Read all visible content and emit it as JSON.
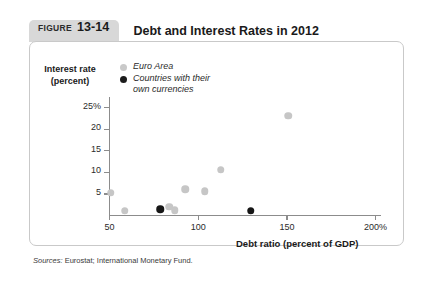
{
  "figure": {
    "label_word": "FIGURE",
    "number": "13-14",
    "title": "Debt and Interest Rates in 2012"
  },
  "legend": {
    "items": [
      {
        "label": "Euro Area",
        "color": "#c9c9c9",
        "series": "euro"
      },
      {
        "label": "Countries with their\nown currencies",
        "color": "#1c1c1c",
        "series": "own"
      }
    ]
  },
  "source": {
    "prefix": "Sources:",
    "text": " Eurostat; International Monetary Fund."
  },
  "chart_data": {
    "type": "scatter",
    "title": "Debt and Interest Rates in 2012",
    "xlabel": "Debt ratio (percent of GDP)",
    "ylabel": "Interest rate (percent)",
    "xlim": [
      40,
      205
    ],
    "ylim": [
      0,
      27
    ],
    "grid": false,
    "legend_position": "top-left-inside",
    "xticks": [
      {
        "value": 50,
        "label": "50"
      },
      {
        "value": 100,
        "label": "100"
      },
      {
        "value": 150,
        "label": "150"
      },
      {
        "value": 200,
        "label": "200%"
      }
    ],
    "yticks": [
      {
        "value": 25,
        "label": "25%"
      },
      {
        "value": 20,
        "label": "20"
      },
      {
        "value": 15,
        "label": "15"
      },
      {
        "value": 10,
        "label": "10"
      },
      {
        "value": 5,
        "label": "5"
      }
    ],
    "series": [
      {
        "name": "Euro Area",
        "color": "#c6c6c6",
        "marker": "circle",
        "points": [
          {
            "x": 51,
            "y": 5.2
          },
          {
            "x": 59,
            "y": 1.0
          },
          {
            "x": 84,
            "y": 1.9
          },
          {
            "x": 87,
            "y": 1.1
          },
          {
            "x": 93,
            "y": 6.0
          },
          {
            "x": 104,
            "y": 5.5
          },
          {
            "x": 113,
            "y": 10.5
          },
          {
            "x": 151,
            "y": 23.0
          }
        ]
      },
      {
        "name": "Countries with their own currencies",
        "color": "#161616",
        "marker": "circle",
        "points": [
          {
            "x": 79,
            "y": 1.3
          },
          {
            "x": 130,
            "y": 1.0
          }
        ]
      }
    ]
  }
}
